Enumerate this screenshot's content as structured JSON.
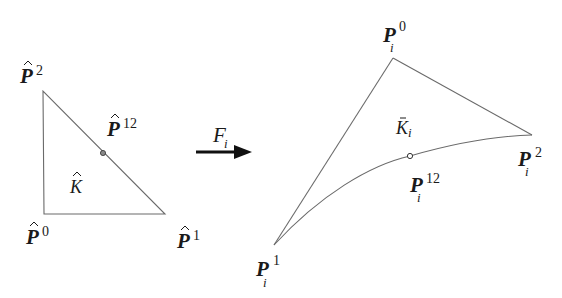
{
  "reference_element": {
    "region_label": {
      "base": "K",
      "accent": "hat"
    },
    "vertices": [
      {
        "id": "P0",
        "base": "P",
        "sup": "0",
        "accent": "hat",
        "x": 44,
        "y": 214
      },
      {
        "id": "P1",
        "base": "P",
        "sup": "1",
        "accent": "hat",
        "x": 165,
        "y": 214
      },
      {
        "id": "P2",
        "base": "P",
        "sup": "2",
        "accent": "hat",
        "x": 43,
        "y": 91
      }
    ],
    "midpoint": {
      "id": "P12",
      "base": "P",
      "sup": "12",
      "accent": "hat",
      "x": 103,
      "y": 153
    }
  },
  "mapping": {
    "base": "F",
    "sub": "i",
    "arrow": "right"
  },
  "physical_element": {
    "region_label": {
      "base": "K",
      "sub": "i",
      "accent": "bar"
    },
    "vertices": [
      {
        "id": "P0",
        "base": "P",
        "sup": "0",
        "sub": "i",
        "x": 393,
        "y": 58
      },
      {
        "id": "P1",
        "base": "P",
        "sup": "1",
        "sub": "i",
        "x": 274,
        "y": 245
      },
      {
        "id": "P2",
        "base": "P",
        "sup": "2",
        "sub": "i",
        "x": 532,
        "y": 135
      }
    ],
    "midpoint": {
      "id": "P12",
      "base": "P",
      "sup": "12",
      "sub": "i",
      "x": 410,
      "y": 156
    },
    "curved_edge": "P1-P12-P2"
  },
  "labels": {
    "ref_p2": {
      "base": "P",
      "sup": "2"
    },
    "ref_p0": {
      "base": "P",
      "sup": "0"
    },
    "ref_p1": {
      "base": "P",
      "sup": "1"
    },
    "ref_p12": {
      "base": "P",
      "sup": "12"
    },
    "ref_k": {
      "base": "K"
    },
    "map_f": {
      "base": "F",
      "sub": "i"
    },
    "phys_p0": {
      "base": "P",
      "sup": "0",
      "sub": "i"
    },
    "phys_p1": {
      "base": "P",
      "sup": "1",
      "sub": "i"
    },
    "phys_p2": {
      "base": "P",
      "sup": "2",
      "sub": "i"
    },
    "phys_p12": {
      "base": "P",
      "sup": "12",
      "sub": "i"
    },
    "phys_k": {
      "base": "K",
      "sub": "i"
    }
  }
}
